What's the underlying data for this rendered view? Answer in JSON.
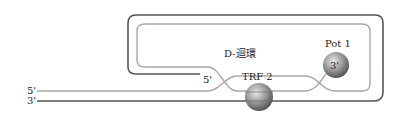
{
  "diagram": {
    "title_label": "D-迴環",
    "labels": {
      "strand_top_5prime": "5'",
      "strand_bottom_3prime": "3'",
      "loop_end_5prime": "5'",
      "trf2": "TRF 2",
      "pot1": "Pot 1",
      "pot1_end": "3'"
    },
    "colors": {
      "outer_strand": "#555555",
      "inner_strand": "#a8a8a8",
      "protein_sphere": "#8c8c8c",
      "text": "#222222",
      "background": "#ffffff"
    }
  }
}
